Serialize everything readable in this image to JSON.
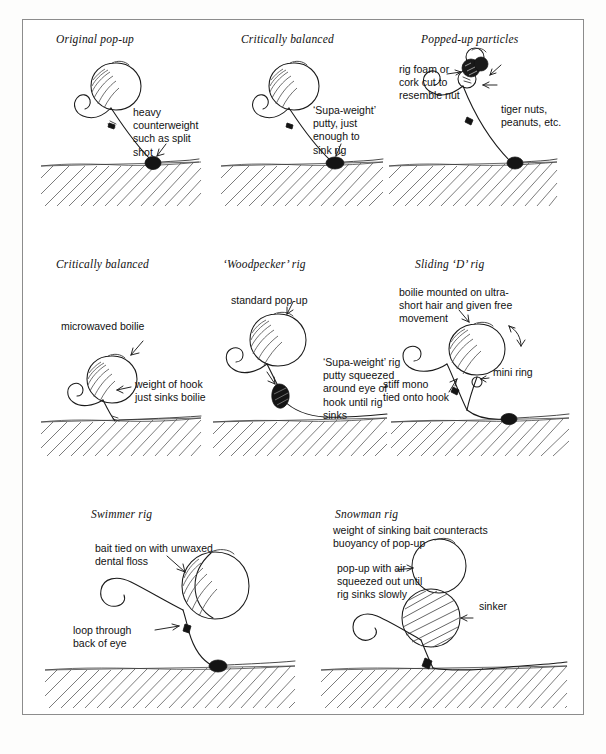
{
  "page": {
    "kind": "illustration-plate",
    "border_color": "#8c8c8c",
    "ink_color": "#1a1a1a",
    "background": "#ffffff"
  },
  "panels": [
    {
      "id": "original-pop-up",
      "title": "Original pop-up",
      "labels": [
        {
          "id": "counterweight",
          "text": "heavy\ncounterweight\nsuch as split\nshot"
        }
      ],
      "features": {
        "bait": "pop-up boilie",
        "weight": "split shot",
        "bed": true
      }
    },
    {
      "id": "critically-balanced-1",
      "title": "Critically balanced",
      "labels": [
        {
          "id": "supa-weight-putty",
          "text": "‘Supa-weight’\nputty, just\nenough to\nsink rig"
        }
      ],
      "features": {
        "bait": "pop-up boilie",
        "weight": "putty",
        "bed": true
      }
    },
    {
      "id": "popped-up-particles",
      "title": "Popped-up particles",
      "labels": [
        {
          "id": "rig-foam",
          "text": "rig foam or\ncork cut to\nresemble nut"
        },
        {
          "id": "particles",
          "text": "tiger nuts,\npeanuts, etc."
        }
      ],
      "features": {
        "bait": "particle cluster",
        "weight": "split shot",
        "bed": true
      }
    },
    {
      "id": "critically-balanced-2",
      "title": "Critically balanced",
      "labels": [
        {
          "id": "microwaved-boilie",
          "text": "microwaved boilie"
        },
        {
          "id": "weight-of-hook",
          "text": "weight of hook\njust sinks boilie"
        }
      ],
      "features": {
        "bait": "microwaved boilie",
        "weight": "hook only",
        "bed": true
      }
    },
    {
      "id": "woodpecker-rig",
      "title": "‘Woodpecker’ rig",
      "labels": [
        {
          "id": "standard-pop-up",
          "text": "standard pop-up"
        },
        {
          "id": "putty-squeezed",
          "text": "‘Supa-weight’ rig\nputty squeezed\naround eye of\nhook until rig\nsinks"
        }
      ],
      "features": {
        "bait": "standard pop-up",
        "weight": "putty at eye",
        "bed": true
      }
    },
    {
      "id": "sliding-d-rig",
      "title": "Sliding ‘D’ rig",
      "labels": [
        {
          "id": "ultra-short-hair",
          "text": "boilie mounted on ultra-\nshort hair and given free\nmovement"
        },
        {
          "id": "mini-ring",
          "text": "mini ring"
        },
        {
          "id": "stiff-mono",
          "text": "stiff mono\ntied onto hook"
        }
      ],
      "features": {
        "bait": "boilie on ultra-short hair",
        "weight": "split shot",
        "bed": true
      }
    },
    {
      "id": "swimmer-rig",
      "title": "Swimmer rig",
      "labels": [
        {
          "id": "dental-floss",
          "text": "bait tied on with unwaxed\ndental floss"
        },
        {
          "id": "loop-through-eye",
          "text": "loop through\nback of eye"
        }
      ],
      "features": {
        "bait": "bait tied with floss",
        "weight": "split shot",
        "bed": true
      }
    },
    {
      "id": "snowman-rig",
      "title": "Snowman rig",
      "labels": [
        {
          "id": "counteracts",
          "text": "weight of sinking bait counteracts\nbuoyancy of pop-up"
        },
        {
          "id": "pop-up-air",
          "text": "pop-up with air\nsqueezed out until\nrig sinks slowly"
        },
        {
          "id": "sinker",
          "text": "sinker"
        }
      ],
      "features": {
        "bait": "pop-up over sinking bait",
        "weight": "sinker bait",
        "bed": true
      }
    }
  ]
}
